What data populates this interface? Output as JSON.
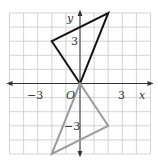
{
  "figure": {
    "type": "coordinate-plane",
    "grid": {
      "xmin": -5,
      "xmax": 5,
      "ymin": -5,
      "ymax": 5,
      "step": 1
    },
    "axes": {
      "x_label": "x",
      "y_label": "y",
      "origin_label": "O",
      "x_ticks": [
        {
          "value": -3,
          "label": "−3"
        },
        {
          "value": 3,
          "label": "3"
        }
      ],
      "y_ticks": [
        {
          "value": 3,
          "label": "3"
        },
        {
          "value": -3,
          "label": "−3"
        }
      ]
    },
    "shapes": [
      {
        "name": "original-triangle",
        "vertices": [
          [
            0,
            0
          ],
          [
            -2,
            3
          ],
          [
            2,
            5
          ]
        ],
        "color": "#111111"
      },
      {
        "name": "image-triangle",
        "vertices": [
          [
            0,
            0
          ],
          [
            2,
            -3
          ],
          [
            -2,
            -5
          ]
        ],
        "color": "#9a9a9a"
      }
    ],
    "colors": {
      "grid": "#c8c8c8",
      "axis": "#333333"
    }
  }
}
